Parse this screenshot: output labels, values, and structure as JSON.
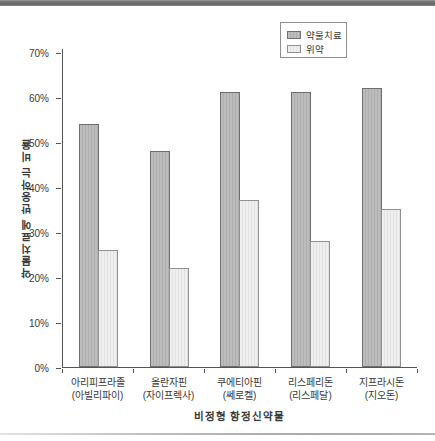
{
  "page": {
    "background": "#ffffff",
    "top_border_color": "#6d6d6d",
    "bottom_border_color": "#b0b0b0"
  },
  "chart_data": {
    "type": "bar",
    "title": "",
    "xlabel": "비정형 항정신약물",
    "ylabel": "약물치료에 반응하는 비율",
    "ylim": [
      0,
      70
    ],
    "ytick_step": 10,
    "ytick_suffix": "%",
    "grid": false,
    "legend_position": "top-right",
    "axis_color": "#555555",
    "categories": [
      {
        "name": "아리피프라졸",
        "brand": "(아빌리파이)"
      },
      {
        "name": "올란자핀",
        "brand": "(자이프렉사)"
      },
      {
        "name": "쿠에티아핀",
        "brand": "(쎄로켈)"
      },
      {
        "name": "리스페리돈",
        "brand": "(리스페달)"
      },
      {
        "name": "지프라시돈",
        "brand": "(지오돈)"
      }
    ],
    "series": [
      {
        "name": "약물치료",
        "values": [
          54,
          48,
          61,
          61,
          62
        ],
        "fill": "#bcbcbc",
        "stripe": "#aeaeae",
        "border": "#6e6e6e"
      },
      {
        "name": "위약",
        "values": [
          26,
          22,
          37,
          28,
          35
        ],
        "fill": "#efefef",
        "stripe": "#e2e2e2",
        "border": "#909090"
      }
    ]
  }
}
